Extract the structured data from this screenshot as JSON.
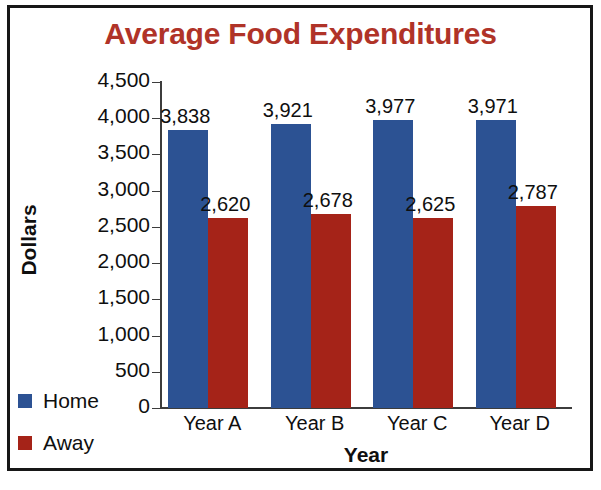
{
  "chart_data": {
    "type": "bar",
    "title": "Average Food Expenditures",
    "xlabel": "Year",
    "ylabel": "Dollars",
    "categories": [
      "Year A",
      "Year B",
      "Year C",
      "Year D"
    ],
    "series": [
      {
        "name": "Home",
        "color": "#2c5293",
        "values": [
          3838,
          3921,
          3977,
          3971
        ],
        "labels": [
          "3,838",
          "3,921",
          "3,977",
          "3,971"
        ]
      },
      {
        "name": "Away",
        "color": "#a52318",
        "values": [
          2620,
          2678,
          2625,
          2787
        ],
        "labels": [
          "2,620",
          "2,678",
          "2,625",
          "2,787"
        ]
      }
    ],
    "ylim": [
      0,
      4500
    ],
    "ytick_step": 500,
    "ytick_labels": [
      "4,500",
      "4,000",
      "3,500",
      "3,000",
      "2,500",
      "2,000",
      "1,500",
      "1,000",
      "500",
      "0"
    ],
    "ytick_values": [
      4500,
      4000,
      3500,
      3000,
      2500,
      2000,
      1500,
      1000,
      500,
      0
    ],
    "grid": false,
    "legend_position": "bottom-left-outside",
    "title_color": "#b03328",
    "axis_color": "#3c3c3c",
    "text_color": "#0f0f0f",
    "background": "#ffffff",
    "border_color": "#171717"
  }
}
